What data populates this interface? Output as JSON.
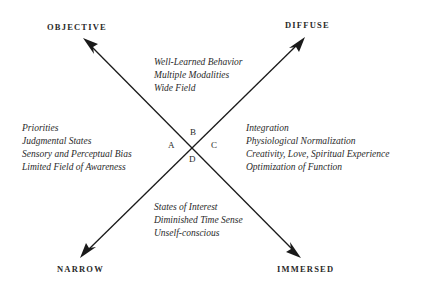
{
  "diagram": {
    "poles": {
      "top_left": "OBJECTIVE",
      "top_right": "DIFFUSE",
      "bottom_left": "NARROW",
      "bottom_right": "IMMERSED"
    },
    "quadrant_letters": {
      "left": "A",
      "top": "B",
      "right": "C",
      "bottom": "D"
    },
    "quadrants": {
      "top": [
        "Well-Learned Behavior",
        "Multiple Modalities",
        "Wide Field"
      ],
      "left": [
        "Priorities",
        "Judgmental States",
        "Sensory and Perceptual Bias",
        "Limited Field of Awareness"
      ],
      "right": [
        "Integration",
        "Physiological Normalization",
        "Creativity, Love, Spiritual Experience",
        "Optimization of Function"
      ],
      "bottom": [
        "States of Interest",
        "Diminished Time Sense",
        "Unself-conscious"
      ]
    },
    "colors": {
      "line": "#1a1a1a",
      "text": "#2a2a2a",
      "background": "#ffffff"
    }
  }
}
